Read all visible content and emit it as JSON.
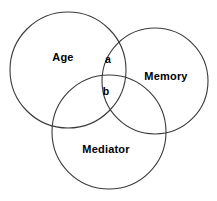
{
  "figure": {
    "type": "venn-diagram-3-set",
    "background_color": "#ffffff",
    "stroke_color": "#3a3a3a",
    "text_color": "#000000",
    "width": 217,
    "height": 201
  },
  "sets": [
    {
      "id": "age",
      "label": "Age",
      "label_x": 63,
      "label_y": 57,
      "circle": {
        "cx": 68,
        "cy": 70,
        "r": 58
      }
    },
    {
      "id": "memory",
      "label": "Memory",
      "label_x": 166,
      "label_y": 76,
      "circle": {
        "cx": 155,
        "cy": 81,
        "r": 53
      }
    },
    {
      "id": "mediator",
      "label": "Mediator",
      "label_x": 106,
      "label_y": 149,
      "circle": {
        "cx": 109,
        "cy": 132,
        "r": 57
      }
    }
  ],
  "regions": [
    {
      "id": "region-a",
      "label": "a",
      "label_x": 108,
      "label_y": 59,
      "members": "Age ∩ Memory"
    },
    {
      "id": "region-b",
      "label": "b",
      "label_x": 106,
      "label_y": 91,
      "members": "Age ∩ Memory ∩ Mediator"
    }
  ]
}
